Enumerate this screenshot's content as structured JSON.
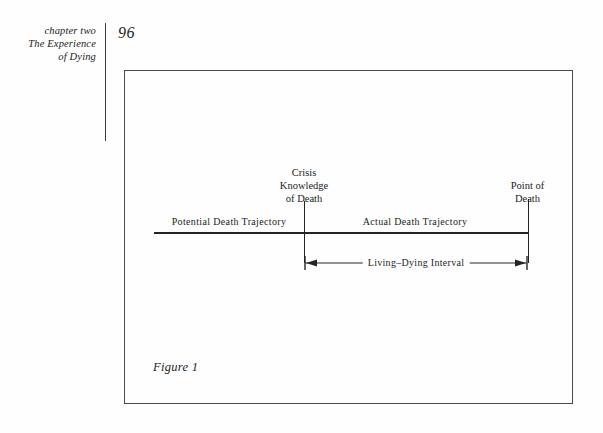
{
  "page": {
    "folio": "96",
    "running_head": {
      "line1": "chapter two",
      "line2": "The Experience",
      "line3": "of Dying"
    }
  },
  "figure": {
    "caption": "Figure 1",
    "diagram": {
      "type": "timeline",
      "above_line_labels": [
        {
          "id": "crisis-knowledge-of-death",
          "line1": "Crisis",
          "line2": "Knowledge",
          "line3": "of Death"
        },
        {
          "id": "point-of-death",
          "line1": "Point of",
          "line2": "Death"
        }
      ],
      "segments": [
        {
          "id": "potential-death-trajectory",
          "label": "Potential Death Trajectory"
        },
        {
          "id": "actual-death-trajectory",
          "label": "Actual Death Trajectory"
        }
      ],
      "interval": {
        "id": "living-dying-interval",
        "label": "Living–Dying Interval"
      }
    }
  },
  "colors": {
    "ink": "#1c1c1c",
    "rule": "#242424",
    "frame": "#4a4a4a",
    "paper": "#fefefe"
  }
}
